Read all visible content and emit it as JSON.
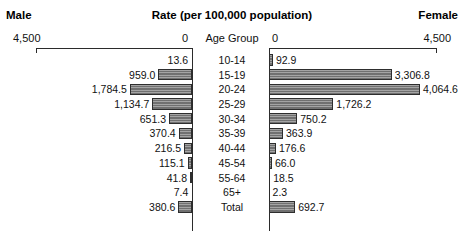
{
  "header": {
    "male_label": "Male",
    "title": "Rate (per 100,000 population)",
    "female_label": "Female"
  },
  "axes": {
    "left_max_label": "4,500",
    "left_zero_label": "0",
    "right_zero_label": "0",
    "right_max_label": "4,500",
    "age_group_header": "Age Group"
  },
  "chart_data": {
    "type": "bar",
    "title": "Rate (per 100,000 population)",
    "xlabel": "Rate (per 100,000 population)",
    "ylabel": "Age Group",
    "orientation": "horizontal",
    "layout": "population-pyramid",
    "grid": false,
    "legend_position": "none",
    "xlim_left": [
      0,
      4500
    ],
    "xlim_right": [
      0,
      4500
    ],
    "left_axis_direction": "right-to-left",
    "right_axis_direction": "left-to-right",
    "categories": [
      "10-14",
      "15-19",
      "20-24",
      "25-29",
      "30-34",
      "35-39",
      "40-44",
      "45-54",
      "55-64",
      "65+",
      "Total"
    ],
    "series": [
      {
        "name": "Male",
        "side": "left",
        "values": [
          13.6,
          959.0,
          1784.5,
          1134.7,
          651.3,
          370.4,
          216.5,
          115.1,
          41.8,
          7.4,
          380.6
        ],
        "labels": [
          "13.6",
          "959.0",
          "1,784.5",
          "1,134.7",
          "651.3",
          "370.4",
          "216.5",
          "115.1",
          "41.8",
          "7.4",
          "380.6"
        ]
      },
      {
        "name": "Female",
        "side": "right",
        "values": [
          92.9,
          3306.8,
          4064.6,
          1726.2,
          750.2,
          363.9,
          176.6,
          66.0,
          18.5,
          2.3,
          692.7
        ],
        "labels": [
          "92.9",
          "3,306.8",
          "4,064.6",
          "1,726.2",
          "750.2",
          "363.9",
          "176.6",
          "66.0",
          "18.5",
          "2.3",
          "692.7"
        ]
      }
    ],
    "colors": {
      "bar_fill": "#7d7d7d",
      "bar_border": "#2e2e2e",
      "axis": "#2b2b2b",
      "text": "#111111",
      "background": "#ffffff"
    }
  }
}
